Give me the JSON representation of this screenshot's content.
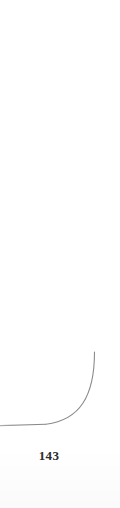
{
  "document": {
    "kind": "scanned-book-page-corner",
    "page_number": "143",
    "background_color": "#ffffff"
  },
  "rule": {
    "name": "border-rule",
    "color": "#8d8d8d",
    "stroke_width": 1.1,
    "description": "thin rule running down the right margin and curving into a horizontal rule toward the left edge",
    "vertical_x": 94.5,
    "vertical_top_y": 0,
    "curve_start_y": 352,
    "corner_radius": 72,
    "horizontal_y": 424.5,
    "horizontal_left_x": 0
  },
  "artifacts": {
    "bottom_smudge_color": "#f7f7f7"
  }
}
